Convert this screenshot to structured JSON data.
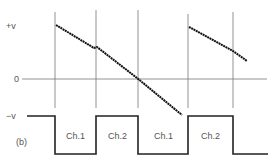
{
  "figure": {
    "part_label": "(b)",
    "y_labels": {
      "plus_v": "+v",
      "zero": "0",
      "minus_v": "−v"
    },
    "channel_labels": [
      "Ch.1",
      "Ch.2",
      "Ch.1",
      "Ch.2"
    ],
    "colors": {
      "line": "#111111",
      "grid": "#666666",
      "text": "#555555"
    }
  }
}
